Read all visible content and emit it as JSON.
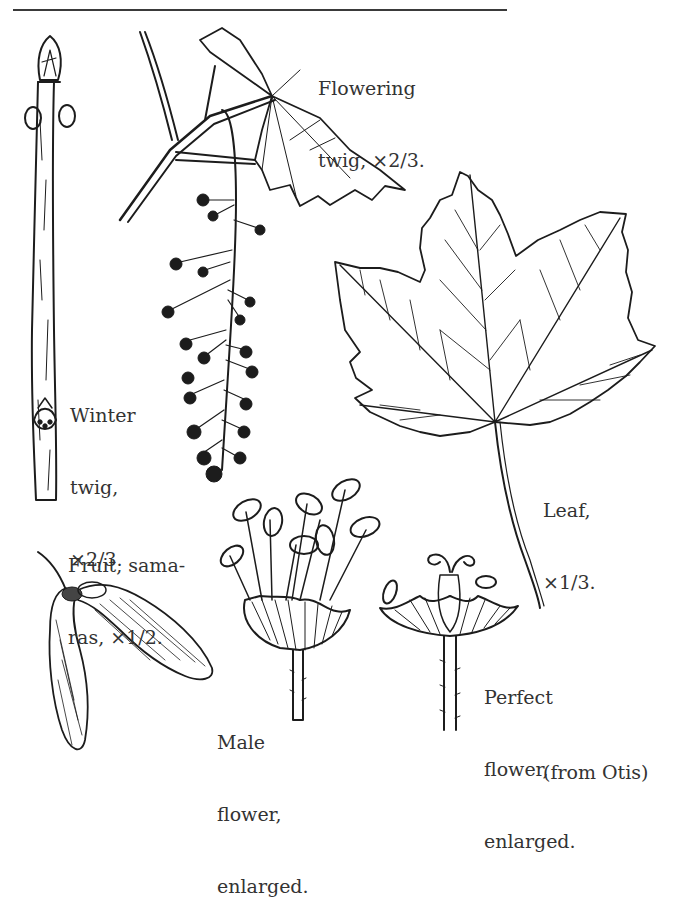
{
  "figure": {
    "top_rule": true,
    "labels": {
      "flowering_twig": [
        "Flowering",
        "twig, ×2/3."
      ],
      "winter_twig": [
        "Winter",
        "twig,",
        "×2/3."
      ],
      "fruit": [
        "Fruit, sama-",
        "ras, ×1/2."
      ],
      "leaf": [
        "Leaf,",
        "×1/3."
      ],
      "male_flower": [
        "Male",
        "flower,",
        "enlarged."
      ],
      "perfect_flower": [
        "Perfect",
        "flower,",
        "enlarged."
      ],
      "credit": "(from Otis)"
    },
    "colors": {
      "ink": "#1c1c1c",
      "text": "#333333",
      "background": "#ffffff"
    }
  }
}
